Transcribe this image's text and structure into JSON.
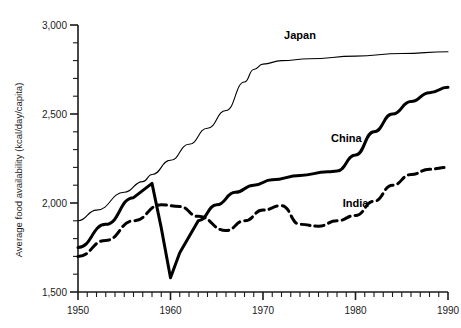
{
  "chart_data": {
    "type": "line",
    "title": "",
    "xlabel": "",
    "ylabel": "Average food availability  (kcal/day/capita)",
    "xlim": [
      1950,
      1990
    ],
    "ylim": [
      1500,
      3000
    ],
    "grid": false,
    "legend_position": "inline-annotations",
    "y_ticks_major": [
      "1,500",
      "2,000",
      "2,500",
      "3,000"
    ],
    "y_tick_values_major": [
      1500,
      2000,
      2500,
      3000
    ],
    "y_tick_minor_step": 100,
    "x_ticks_major": [
      "1950",
      "1960",
      "1970",
      "1980",
      "1990"
    ],
    "x_tick_values_major": [
      1950,
      1960,
      1970,
      1980,
      1990
    ],
    "x_tick_minor_step": 1,
    "series": [
      {
        "name": "Japan",
        "style": "thin-solid",
        "label_x": 1974,
        "label_y": 2920,
        "x": [
          1950,
          1952,
          1955,
          1957,
          1958,
          1960,
          1962,
          1964,
          1966,
          1968,
          1969,
          1970,
          1972,
          1975,
          1980,
          1985,
          1990
        ],
        "values": [
          1900,
          1960,
          2060,
          2120,
          2160,
          2240,
          2330,
          2420,
          2520,
          2680,
          2750,
          2780,
          2800,
          2810,
          2825,
          2840,
          2850
        ]
      },
      {
        "name": "China",
        "style": "thick-solid",
        "label_x": 1979,
        "label_y": 2340,
        "x": [
          1950,
          1953,
          1956,
          1958,
          1959,
          1960,
          1961,
          1963,
          1965,
          1967,
          1969,
          1971,
          1974,
          1977,
          1978,
          1980,
          1982,
          1984,
          1986,
          1988,
          1990
        ],
        "values": [
          1750,
          1880,
          2030,
          2110,
          1860,
          1580,
          1720,
          1900,
          1990,
          2060,
          2100,
          2130,
          2155,
          2175,
          2180,
          2270,
          2400,
          2500,
          2570,
          2620,
          2650
        ]
      },
      {
        "name": "India",
        "style": "thick-dashed",
        "label_x": 1980,
        "label_y": 1980,
        "x": [
          1950,
          1953,
          1956,
          1959,
          1961,
          1963,
          1966,
          1968,
          1970,
          1972,
          1974,
          1976,
          1978,
          1980,
          1982,
          1984,
          1986,
          1988,
          1990
        ],
        "values": [
          1700,
          1790,
          1900,
          1990,
          1980,
          1925,
          1845,
          1900,
          1960,
          1985,
          1880,
          1870,
          1900,
          1930,
          2010,
          2100,
          2160,
          2190,
          2200
        ]
      }
    ]
  }
}
